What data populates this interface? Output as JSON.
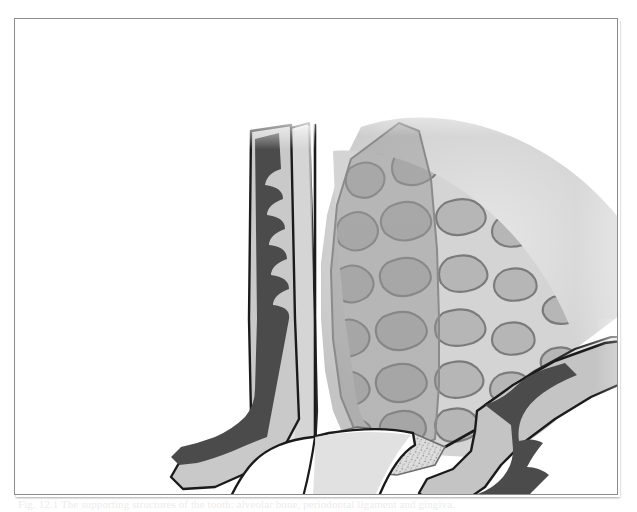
{
  "document": {
    "kind": "anatomical-illustration-plate",
    "background_color": "#ffffff",
    "frame_color": "#8c8c8c"
  },
  "caption": {
    "text": "Fig. 12.1 The supporting structures of the tooth: alveolar bone, periodontal ligament and gingiva.",
    "visible_note": "clipped at bottom edge of scan"
  },
  "figure": {
    "palette": {
      "bone_matrix": "#cfcfcf",
      "bone_matrix_light": "#dcdcdc",
      "marrow_space": "#b3b3b3",
      "marrow_outline": "#7a7a7a",
      "cortical_plate": "#e2e2e2",
      "epithelium_dark": "#4a4a4a",
      "gingiva_mid": "#9a9a9a",
      "socket_overlay": "#a9a9a9",
      "tooth_fill": "#ffffff",
      "ink_outline": "#1b1b1b",
      "pdl_fibres": "#8e8e8e"
    },
    "parts": [
      {
        "id": "alveolar-bone",
        "label": "Alveolar bone (trabecular)"
      },
      {
        "id": "cortical-plate-left",
        "label": "Buccal cortical plate"
      },
      {
        "id": "cortical-plate-right",
        "label": "Lingual cortical plate"
      },
      {
        "id": "tooth-socket",
        "label": "Tooth socket / root outline"
      },
      {
        "id": "gingiva-left",
        "label": "Gingival flap (left)"
      },
      {
        "id": "gingiva-right",
        "label": "Gingival flap (right)"
      },
      {
        "id": "junctional-epithelium",
        "label": "Junctional epithelium"
      },
      {
        "id": "periodontal-ligament",
        "label": "Periodontal ligament"
      },
      {
        "id": "tooth",
        "label": "Incisor tooth"
      },
      {
        "id": "pulp-line",
        "label": "Pulp chamber outline"
      }
    ],
    "trabeculae": {
      "count": 74,
      "description": "Irregular rounded marrow spaces separated by bony trabeculae"
    }
  }
}
